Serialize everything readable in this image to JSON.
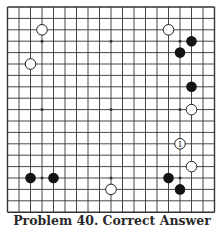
{
  "caption": "Problem 40. Correct Answer",
  "board": {
    "size": 19,
    "origin": {
      "x": 7.5,
      "y": 7
    },
    "spacing": {
      "x": 11.5,
      "y": 11.4
    },
    "line_color": "#333333",
    "black_color": "#141414",
    "white_fill": "#ffffff",
    "white_stroke": "#222222"
  },
  "stones": [
    {
      "color": "white",
      "col": 3,
      "row": 2
    },
    {
      "color": "white",
      "col": 2,
      "row": 5
    },
    {
      "color": "white",
      "col": 14,
      "row": 2
    },
    {
      "color": "black",
      "col": 16,
      "row": 3
    },
    {
      "color": "black",
      "col": 15,
      "row": 4
    },
    {
      "color": "black",
      "col": 16,
      "row": 7
    },
    {
      "color": "white",
      "col": 16,
      "row": 9
    },
    {
      "color": "white",
      "col": 15,
      "row": 12,
      "label": "1"
    },
    {
      "color": "white",
      "col": 16,
      "row": 14
    },
    {
      "color": "black",
      "col": 2,
      "row": 15
    },
    {
      "color": "black",
      "col": 4,
      "row": 15
    },
    {
      "color": "white",
      "col": 9,
      "row": 16
    },
    {
      "color": "black",
      "col": 14,
      "row": 15
    },
    {
      "color": "black",
      "col": 15,
      "row": 16
    }
  ]
}
